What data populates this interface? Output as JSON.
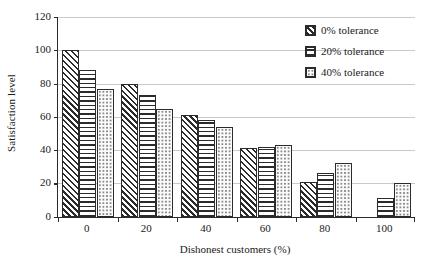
{
  "chart_data": {
    "type": "bar",
    "title": "",
    "subtitle": "",
    "xlabel": "Dishonest customers (%)",
    "ylabel": "Satisfaction level",
    "categories": [
      "0",
      "20",
      "40",
      "60",
      "80",
      "100"
    ],
    "series": [
      {
        "name": "0% tolerance",
        "pattern": "diagonal-hatch",
        "values": [
          100,
          80,
          61,
          41,
          21,
          0
        ]
      },
      {
        "name": "20% tolerance",
        "pattern": "horizontal-lines",
        "values": [
          88,
          73,
          58,
          42,
          26,
          11
        ]
      },
      {
        "name": "40% tolerance",
        "pattern": "dotted",
        "values": [
          77,
          65,
          54,
          43,
          32,
          20
        ]
      }
    ],
    "ylim": [
      0,
      120
    ],
    "yticks": [
      0,
      20,
      40,
      60,
      80,
      100,
      120
    ],
    "ytick_labels": [
      "0",
      "20",
      "40",
      "60",
      "80",
      "100",
      "120"
    ],
    "xtick_labels": [
      "0",
      "20",
      "40",
      "60",
      "80",
      "100"
    ],
    "grid": "horizontal",
    "legend_position": "top-right",
    "colors": {
      "outline": "#2b2b2b",
      "fill": "#ffffff",
      "gridline": "#c9c9c9",
      "text": "#1a1a1a",
      "background": "#ffffff"
    }
  },
  "legend": {
    "entries": [
      {
        "label": "0% tolerance"
      },
      {
        "label": "20% tolerance"
      },
      {
        "label": "40% tolerance"
      }
    ]
  }
}
